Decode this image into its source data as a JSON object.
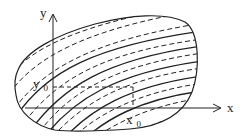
{
  "diagram": {
    "axes": {
      "x_label": "x",
      "y_label": "y"
    },
    "point": {
      "x_label_main": "x",
      "x_label_sub": "0",
      "y_label_main": "y",
      "y_label_sub": "0"
    },
    "curves": {
      "solid_count": 5,
      "dashed_style": "dashed",
      "solid_style": "solid"
    },
    "colors": {
      "stroke": "#222222",
      "background": "#ffffff"
    }
  }
}
